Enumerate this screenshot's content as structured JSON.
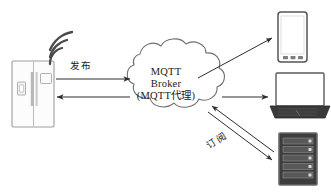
{
  "diagram": {
    "background_color": "#ffffff",
    "stroke_color": "#3b3b3b",
    "text_color": "#1a1a1a",
    "broker": {
      "shape": "cloud",
      "line1": "MQTT",
      "line2": "Broker",
      "line3": "(MQTT代理)"
    },
    "labels": {
      "publish": "发布",
      "subscribe": "订阅"
    },
    "nodes": [
      {
        "id": "refrigerator",
        "name": "refrigerator-device",
        "role": "publisher"
      },
      {
        "id": "wifi",
        "name": "wifi-signal",
        "role": "wireless-link"
      },
      {
        "id": "smartphone",
        "name": "smartphone-device",
        "role": "subscriber"
      },
      {
        "id": "laptop",
        "name": "laptop-device",
        "role": "subscriber"
      },
      {
        "id": "server",
        "name": "server-rack-device",
        "role": "subscriber"
      }
    ],
    "connections": [
      {
        "from": "refrigerator",
        "to": "broker",
        "label": "发布",
        "direction": "right"
      },
      {
        "from": "broker",
        "to": "refrigerator",
        "label": "",
        "direction": "left"
      },
      {
        "from": "broker",
        "to": "smartphone",
        "label": "",
        "direction": "up-right"
      },
      {
        "from": "broker",
        "to": "laptop",
        "label": "",
        "direction": "right"
      },
      {
        "from": "server",
        "to": "broker",
        "label": "订阅",
        "direction": "up-left"
      },
      {
        "from": "broker",
        "to": "server",
        "label": "",
        "direction": "down-right"
      }
    ],
    "colors": {
      "stroke": "#3b3b3b",
      "device_fill": "#fdfdfd",
      "device_stroke": "#9a9a9a",
      "dark_device": "#3a3a3a",
      "screen": "#ffffff"
    }
  }
}
